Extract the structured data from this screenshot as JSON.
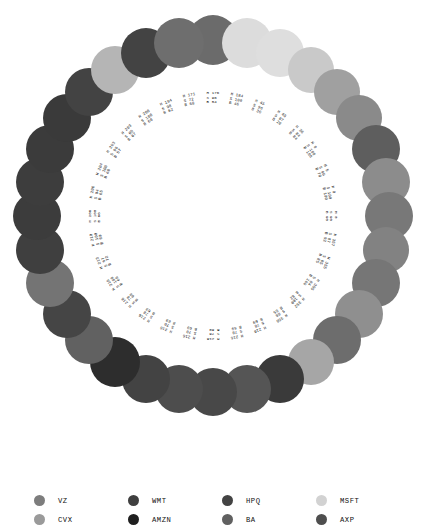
{
  "chart_data": {
    "type": "scatter",
    "title": "",
    "subtitle": "",
    "xlabel": "",
    "ylabel": "",
    "layout": "radial-ring",
    "center": [
      213,
      216
    ],
    "ring_radius": 176,
    "label_radius": 118,
    "node_count": 32,
    "grid": false,
    "legend_position": "bottom",
    "value_prefixes": [
      "H",
      "S",
      "B"
    ],
    "points": [
      {
        "index": 0,
        "angle_deg": -90.0,
        "H": 176,
        "S": 96,
        "B": 54,
        "color": "#6b6b6b",
        "r": 25
      },
      {
        "index": 1,
        "angle_deg": -78.75,
        "H": 184,
        "S": 100,
        "B": 46,
        "color": "#dcdcdc",
        "r": 25
      },
      {
        "index": 2,
        "angle_deg": -67.5,
        "H": 45,
        "S": 96,
        "B": 36,
        "color": "#dedede",
        "r": 24
      },
      {
        "index": 3,
        "angle_deg": -56.25,
        "H": 45,
        "S": 87,
        "B": 20,
        "color": "#c9c9c9",
        "r": 23
      },
      {
        "index": 4,
        "angle_deg": -45.0,
        "H": 36,
        "S": 84,
        "B": 84,
        "color": "#a0a0a0",
        "r": 23
      },
      {
        "index": 5,
        "angle_deg": -33.75,
        "H": 0,
        "S": 100,
        "B": 100,
        "color": "#8a8a8a",
        "r": 23
      },
      {
        "index": 6,
        "angle_deg": -22.5,
        "H": 5,
        "S": 99,
        "B": 70,
        "color": "#5e5e5e",
        "r": 24
      },
      {
        "index": 7,
        "angle_deg": -11.25,
        "H": 0,
        "S": 100,
        "B": 100,
        "color": "#8c8c8c",
        "r": 24
      },
      {
        "index": 8,
        "angle_deg": 0.0,
        "H": 0,
        "S": 90,
        "B": 90,
        "color": "#787878",
        "r": 24
      },
      {
        "index": 9,
        "angle_deg": 11.25,
        "H": 357,
        "S": 87,
        "B": 92,
        "color": "#828282",
        "r": 23
      },
      {
        "index": 10,
        "angle_deg": 22.5,
        "H": 355,
        "S": 85,
        "B": 85,
        "color": "#767676",
        "r": 24
      },
      {
        "index": 11,
        "angle_deg": 33.75,
        "H": 355,
        "S": 84,
        "B": 100,
        "color": "#8f8f8f",
        "r": 24
      },
      {
        "index": 12,
        "angle_deg": 45.0,
        "H": 352,
        "S": 100,
        "B": 82,
        "color": "#6d6d6d",
        "r": 24
      },
      {
        "index": 13,
        "angle_deg": 56.25,
        "H": 350,
        "S": 80,
        "B": 55,
        "color": "#a6a6a6",
        "r": 23
      },
      {
        "index": 14,
        "angle_deg": 67.5,
        "H": 216,
        "S": 78,
        "B": 69,
        "color": "#3a3a3a",
        "r": 24
      },
      {
        "index": 15,
        "angle_deg": 78.75,
        "H": 216,
        "S": 78,
        "B": 69,
        "color": "#555555",
        "r": 24
      },
      {
        "index": 16,
        "angle_deg": 90.0,
        "H": 216,
        "S": 70,
        "B": 69,
        "color": "#484848",
        "r": 24
      },
      {
        "index": 17,
        "angle_deg": 101.25,
        "H": 216,
        "S": 70,
        "B": 69,
        "color": "#4d4d4d",
        "r": 24
      },
      {
        "index": 18,
        "angle_deg": 112.5,
        "H": 216,
        "S": 70,
        "B": 69,
        "color": "#434343",
        "r": 24
      },
      {
        "index": 19,
        "angle_deg": 123.75,
        "H": 216,
        "S": 78,
        "B": 69,
        "color": "#2d2d2d",
        "r": 25
      },
      {
        "index": 20,
        "angle_deg": 135.0,
        "H": 216,
        "S": 78,
        "B": 69,
        "color": "#616161",
        "r": 24
      },
      {
        "index": 21,
        "angle_deg": 146.25,
        "H": 210,
        "S": 100,
        "B": 60,
        "color": "#454545",
        "r": 24
      },
      {
        "index": 22,
        "angle_deg": 157.5,
        "H": 213,
        "S": 67,
        "B": 72,
        "color": "#747474",
        "r": 24
      },
      {
        "index": 23,
        "angle_deg": 168.75,
        "H": 210,
        "S": 100,
        "B": 60,
        "color": "#3f3f3f",
        "r": 24
      },
      {
        "index": 24,
        "angle_deg": 180.0,
        "H": 206,
        "S": 100,
        "B": 66,
        "color": "#3c3c3c",
        "r": 24
      },
      {
        "index": 25,
        "angle_deg": 191.25,
        "H": 206,
        "S": 94,
        "B": 65,
        "color": "#3d3d3d",
        "r": 24
      },
      {
        "index": 26,
        "angle_deg": 202.5,
        "H": 204,
        "S": 100,
        "B": 60,
        "color": "#3b3b3b",
        "r": 24
      },
      {
        "index": 27,
        "angle_deg": 213.75,
        "H": 203,
        "S": 96,
        "B": 57,
        "color": "#3a3a3a",
        "r": 24
      },
      {
        "index": 28,
        "angle_deg": 225.0,
        "H": 203,
        "S": 65,
        "B": 67,
        "color": "#434343",
        "r": 24
      },
      {
        "index": 29,
        "angle_deg": 236.25,
        "H": 200,
        "S": 100,
        "B": 60,
        "color": "#b5b5b5",
        "r": 24
      },
      {
        "index": 30,
        "angle_deg": 247.5,
        "H": 194,
        "S": 98,
        "B": 62,
        "color": "#434343",
        "r": 25
      },
      {
        "index": 31,
        "angle_deg": 258.75,
        "H": 171,
        "S": 72,
        "B": 68,
        "color": "#6e6e6e",
        "r": 25
      }
    ]
  },
  "legend": {
    "rows": [
      [
        {
          "label": "VZ",
          "color": "#7d7d7d"
        },
        {
          "label": "WMT",
          "color": "#3f3f3f"
        },
        {
          "label": "HPQ",
          "color": "#434343"
        },
        {
          "label": "MSFT",
          "color": "#d2d2d2"
        }
      ],
      [
        {
          "label": "CVX",
          "color": "#9a9a9a"
        },
        {
          "label": "AMZN",
          "color": "#1f1f1f"
        },
        {
          "label": "BA",
          "color": "#606060"
        },
        {
          "label": "AXP",
          "color": "#4e4e4e"
        }
      ]
    ]
  }
}
